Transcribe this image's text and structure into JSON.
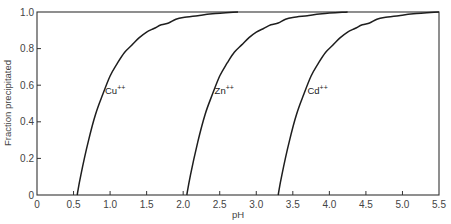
{
  "chart_data": {
    "type": "line",
    "title": "",
    "xlabel": "pH",
    "ylabel": "Fraction precipitated",
    "xlim": [
      0,
      5.5
    ],
    "ylim": [
      0,
      1.0
    ],
    "grid": false,
    "legend": "inline labels on curves",
    "x_ticks": [
      "0",
      "0.5",
      "1.0",
      "1.5",
      "2.0",
      "2.5",
      "3.0",
      "3.5",
      "4.0",
      "4.5",
      "5.0",
      "5.5"
    ],
    "y_ticks": [
      "0",
      "0.2",
      "0.4",
      "0.6",
      "0.8",
      "1.0"
    ],
    "series": [
      {
        "name": "Cu++",
        "label": "Cu",
        "charge": "++",
        "x": [
          0.55,
          0.6,
          0.7,
          0.8,
          0.9,
          1.0,
          1.1,
          1.2,
          1.3,
          1.4,
          1.5,
          1.6,
          1.7,
          1.8,
          1.9,
          2.0,
          2.2,
          2.4
        ],
        "y": [
          0.0,
          0.11,
          0.29,
          0.44,
          0.55,
          0.65,
          0.72,
          0.78,
          0.82,
          0.86,
          0.89,
          0.91,
          0.93,
          0.94,
          0.96,
          0.97,
          0.98,
          0.99
        ]
      },
      {
        "name": "Zn++",
        "label": "Zn",
        "charge": "++",
        "x": [
          2.05,
          2.1,
          2.2,
          2.3,
          2.4,
          2.5,
          2.6,
          2.7,
          2.8,
          2.9,
          3.0,
          3.1,
          3.2,
          3.3,
          3.4,
          3.5,
          3.7,
          3.9
        ],
        "y": [
          0.0,
          0.11,
          0.29,
          0.44,
          0.55,
          0.65,
          0.72,
          0.78,
          0.82,
          0.86,
          0.89,
          0.91,
          0.93,
          0.94,
          0.96,
          0.97,
          0.98,
          0.99
        ]
      },
      {
        "name": "Cd++",
        "label": "Cd",
        "charge": "++",
        "x": [
          3.3,
          3.35,
          3.45,
          3.55,
          3.65,
          3.75,
          3.85,
          3.95,
          4.05,
          4.15,
          4.25,
          4.35,
          4.45,
          4.55,
          4.65,
          4.75,
          4.95,
          5.15
        ],
        "y": [
          0.0,
          0.11,
          0.29,
          0.44,
          0.55,
          0.65,
          0.72,
          0.78,
          0.82,
          0.86,
          0.89,
          0.91,
          0.93,
          0.94,
          0.96,
          0.97,
          0.98,
          0.99
        ]
      }
    ],
    "label_positions": [
      {
        "series": "Cu++",
        "x": 0.93,
        "y": 0.55
      },
      {
        "series": "Zn++",
        "x": 2.43,
        "y": 0.55
      },
      {
        "series": "Cd++",
        "x": 3.7,
        "y": 0.55
      }
    ]
  },
  "colors": {
    "line": "#1e1e1e",
    "axis": "#333333",
    "text": "#444444",
    "background": "#ffffff"
  }
}
